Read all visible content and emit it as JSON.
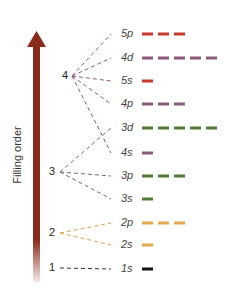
{
  "axis": {
    "label": "Filling order",
    "arrow_color": "#8b2a1a"
  },
  "shells": [
    {
      "n": "4",
      "x": 65,
      "y": 76,
      "color": "#8a5b7d"
    },
    {
      "n": "3",
      "x": 52,
      "y": 172,
      "color": "#6e6e6e"
    },
    {
      "n": "2",
      "x": 52,
      "y": 233,
      "color": "#e0a050"
    },
    {
      "n": "1",
      "x": 52,
      "y": 268,
      "color": "#222222"
    }
  ],
  "orbitals": [
    {
      "label": "5p",
      "y": 34,
      "count": 3,
      "color": "#c8392b",
      "shell": "4"
    },
    {
      "label": "4d",
      "y": 58,
      "count": 5,
      "color": "#8a5b7d",
      "shell": "4"
    },
    {
      "label": "5s",
      "y": 81,
      "count": 1,
      "color": "#c8392b",
      "shell": "4"
    },
    {
      "label": "4p",
      "y": 104,
      "count": 3,
      "color": "#8a5b7d",
      "shell": "4"
    },
    {
      "label": "3d",
      "y": 128,
      "count": 5,
      "color": "#4e7a3a",
      "shell": "3"
    },
    {
      "label": "4s",
      "y": 153,
      "count": 1,
      "color": "#8a5b7d",
      "shell": "4"
    },
    {
      "label": "3p",
      "y": 176,
      "count": 3,
      "color": "#4e7a3a",
      "shell": "3"
    },
    {
      "label": "3s",
      "y": 199,
      "count": 1,
      "color": "#4e7a3a",
      "shell": "3"
    },
    {
      "label": "2p",
      "y": 223,
      "count": 3,
      "color": "#e8a64e",
      "shell": "2"
    },
    {
      "label": "2s",
      "y": 245,
      "count": 1,
      "color": "#e8a64e",
      "shell": "2"
    },
    {
      "label": "1s",
      "y": 269,
      "count": 1,
      "color": "#111111",
      "shell": "1"
    }
  ]
}
